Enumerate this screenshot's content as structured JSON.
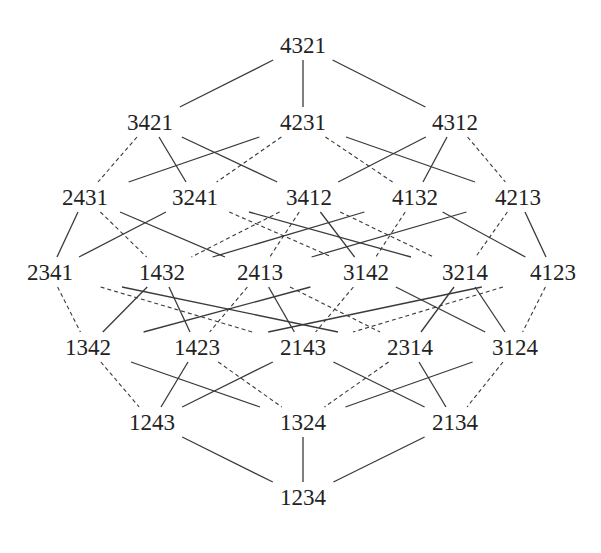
{
  "diagram": {
    "type": "hasse-diagram",
    "nodes": [
      {
        "id": "4321",
        "label": "4321",
        "x": 303,
        "y": 45
      },
      {
        "id": "3421",
        "label": "3421",
        "x": 150,
        "y": 122
      },
      {
        "id": "4231",
        "label": "4231",
        "x": 303,
        "y": 122
      },
      {
        "id": "4312",
        "label": "4312",
        "x": 455,
        "y": 122
      },
      {
        "id": "2431",
        "label": "2431",
        "x": 85,
        "y": 197
      },
      {
        "id": "3241",
        "label": "3241",
        "x": 195,
        "y": 197
      },
      {
        "id": "3412",
        "label": "3412",
        "x": 309,
        "y": 197
      },
      {
        "id": "4132",
        "label": "4132",
        "x": 415,
        "y": 197
      },
      {
        "id": "4213",
        "label": "4213",
        "x": 518,
        "y": 197
      },
      {
        "id": "2341",
        "label": "2341",
        "x": 50,
        "y": 272
      },
      {
        "id": "1432",
        "label": "1432",
        "x": 162,
        "y": 272
      },
      {
        "id": "2413",
        "label": "2413",
        "x": 260,
        "y": 272
      },
      {
        "id": "3142",
        "label": "3142",
        "x": 366,
        "y": 272
      },
      {
        "id": "3214",
        "label": "3214",
        "x": 465,
        "y": 272
      },
      {
        "id": "4123",
        "label": "4123",
        "x": 553,
        "y": 272
      },
      {
        "id": "1342",
        "label": "1342",
        "x": 88,
        "y": 347
      },
      {
        "id": "1423",
        "label": "1423",
        "x": 197,
        "y": 347
      },
      {
        "id": "2143",
        "label": "2143",
        "x": 303,
        "y": 347
      },
      {
        "id": "2314",
        "label": "2314",
        "x": 410,
        "y": 347
      },
      {
        "id": "3124",
        "label": "3124",
        "x": 515,
        "y": 347
      },
      {
        "id": "1243",
        "label": "1243",
        "x": 152,
        "y": 422
      },
      {
        "id": "1324",
        "label": "1324",
        "x": 303,
        "y": 422
      },
      {
        "id": "2134",
        "label": "2134",
        "x": 455,
        "y": 422
      },
      {
        "id": "1234",
        "label": "1234",
        "x": 303,
        "y": 497
      }
    ],
    "edges": [
      {
        "from": "4321",
        "to": "3421",
        "style": "solid"
      },
      {
        "from": "4321",
        "to": "4231",
        "style": "solid"
      },
      {
        "from": "4321",
        "to": "4312",
        "style": "solid"
      },
      {
        "from": "3421",
        "to": "2431",
        "style": "dashed"
      },
      {
        "from": "3421",
        "to": "3241",
        "style": "solid"
      },
      {
        "from": "3421",
        "to": "3412",
        "style": "solid"
      },
      {
        "from": "4231",
        "to": "2431",
        "style": "solid"
      },
      {
        "from": "4231",
        "to": "3241",
        "style": "dashed"
      },
      {
        "from": "4231",
        "to": "4132",
        "style": "dashed"
      },
      {
        "from": "4231",
        "to": "4213",
        "style": "solid"
      },
      {
        "from": "4312",
        "to": "3412",
        "style": "solid"
      },
      {
        "from": "4312",
        "to": "4132",
        "style": "solid"
      },
      {
        "from": "4312",
        "to": "4213",
        "style": "dashed"
      },
      {
        "from": "2431",
        "to": "2341",
        "style": "solid"
      },
      {
        "from": "2431",
        "to": "1432",
        "style": "dashed"
      },
      {
        "from": "2431",
        "to": "2413",
        "style": "solid"
      },
      {
        "from": "3241",
        "to": "2341",
        "style": "solid"
      },
      {
        "from": "3241",
        "to": "3142",
        "style": "dashed"
      },
      {
        "from": "3241",
        "to": "3214",
        "style": "solid"
      },
      {
        "from": "3412",
        "to": "1432",
        "style": "dashed"
      },
      {
        "from": "3412",
        "to": "2413",
        "style": "dashed"
      },
      {
        "from": "3412",
        "to": "3142",
        "style": "solid"
      },
      {
        "from": "3412",
        "to": "3214",
        "style": "dashed"
      },
      {
        "from": "4132",
        "to": "1432",
        "style": "solid"
      },
      {
        "from": "4132",
        "to": "3142",
        "style": "dashed"
      },
      {
        "from": "4132",
        "to": "4123",
        "style": "solid"
      },
      {
        "from": "4213",
        "to": "2413",
        "style": "solid"
      },
      {
        "from": "4213",
        "to": "3214",
        "style": "dashed"
      },
      {
        "from": "4213",
        "to": "4123",
        "style": "solid"
      },
      {
        "from": "2341",
        "to": "1342",
        "style": "dashed"
      },
      {
        "from": "2341",
        "to": "2143",
        "style": "dashed"
      },
      {
        "from": "2341",
        "to": "2314",
        "style": "solid"
      },
      {
        "from": "1432",
        "to": "1342",
        "style": "solid"
      },
      {
        "from": "1432",
        "to": "1423",
        "style": "solid"
      },
      {
        "from": "2413",
        "to": "1423",
        "style": "dashed"
      },
      {
        "from": "2413",
        "to": "2143",
        "style": "solid"
      },
      {
        "from": "2413",
        "to": "2314",
        "style": "dashed"
      },
      {
        "from": "3142",
        "to": "1342",
        "style": "solid"
      },
      {
        "from": "3142",
        "to": "2143",
        "style": "dashed"
      },
      {
        "from": "3142",
        "to": "3124",
        "style": "solid"
      },
      {
        "from": "3214",
        "to": "2314",
        "style": "solid"
      },
      {
        "from": "3214",
        "to": "3124",
        "style": "solid"
      },
      {
        "from": "4123",
        "to": "1423",
        "style": "solid"
      },
      {
        "from": "4123",
        "to": "2143",
        "style": "dashed"
      },
      {
        "from": "4123",
        "to": "3124",
        "style": "dashed"
      },
      {
        "from": "1342",
        "to": "1243",
        "style": "dashed"
      },
      {
        "from": "1342",
        "to": "1324",
        "style": "solid"
      },
      {
        "from": "1423",
        "to": "1243",
        "style": "solid"
      },
      {
        "from": "1423",
        "to": "1324",
        "style": "dashed"
      },
      {
        "from": "2143",
        "to": "1243",
        "style": "solid"
      },
      {
        "from": "2143",
        "to": "2134",
        "style": "solid"
      },
      {
        "from": "2314",
        "to": "1324",
        "style": "dashed"
      },
      {
        "from": "2314",
        "to": "2134",
        "style": "solid"
      },
      {
        "from": "3124",
        "to": "1324",
        "style": "solid"
      },
      {
        "from": "3124",
        "to": "2134",
        "style": "dashed"
      },
      {
        "from": "1243",
        "to": "1234",
        "style": "solid"
      },
      {
        "from": "1324",
        "to": "1234",
        "style": "solid"
      },
      {
        "from": "2134",
        "to": "1234",
        "style": "solid"
      }
    ]
  }
}
